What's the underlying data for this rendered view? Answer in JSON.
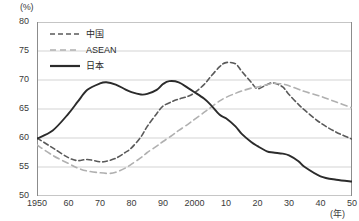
{
  "chart_data": {
    "type": "line",
    "title": "",
    "subtitle": "",
    "ylabel": "(%)",
    "xlabel": "(年)",
    "ylim": [
      50,
      80
    ],
    "xlim": [
      1950,
      2050
    ],
    "yticks": [
      50,
      55,
      60,
      65,
      70,
      75,
      80
    ],
    "ytick_labels": [
      "50",
      "55",
      "60",
      "65",
      "70",
      "75",
      "80"
    ],
    "xticks": [
      1950,
      1960,
      1970,
      1980,
      1990,
      2000,
      2010,
      2020,
      2030,
      2040,
      2050
    ],
    "xtick_labels": [
      "1950",
      "60",
      "70",
      "80",
      "90",
      "2000",
      "10",
      "20",
      "30",
      "40",
      "50"
    ],
    "grid": true,
    "grid_axis": "y",
    "legend_position": "top-left",
    "series": [
      {
        "name": "中国",
        "style": "dashed",
        "color": "#5a5a5a",
        "x": [
          1950,
          1955,
          1960,
          1963,
          1966,
          1970,
          1972,
          1975,
          1978,
          1980,
          1983,
          1985,
          1988,
          1990,
          1993,
          1995,
          1998,
          2000,
          2003,
          2005,
          2008,
          2010,
          2013,
          2015,
          2018,
          2020,
          2023,
          2025,
          2028,
          2030,
          2033,
          2035,
          2040,
          2045,
          2050
        ],
        "values": [
          60.0,
          58.3,
          56.6,
          56.1,
          56.3,
          55.9,
          56.0,
          56.5,
          57.5,
          58.3,
          60.2,
          62.0,
          64.2,
          65.5,
          66.3,
          66.7,
          67.2,
          67.8,
          69.2,
          70.5,
          72.3,
          73.0,
          72.8,
          71.5,
          69.6,
          68.5,
          69.2,
          69.5,
          68.8,
          67.5,
          65.8,
          64.8,
          62.6,
          61.0,
          59.8
        ]
      },
      {
        "name": "ASEAN",
        "style": "dashed",
        "color": "#b0b0b0",
        "x": [
          1950,
          1955,
          1960,
          1963,
          1966,
          1970,
          1973,
          1975,
          1978,
          1980,
          1983,
          1985,
          1988,
          1990,
          1993,
          1995,
          1998,
          2000,
          2003,
          2005,
          2008,
          2010,
          2013,
          2015,
          2018,
          2020,
          2023,
          2025,
          2028,
          2030,
          2033,
          2035,
          2040,
          2045,
          2050
        ],
        "values": [
          58.8,
          57.0,
          55.6,
          54.8,
          54.3,
          54.0,
          53.9,
          54.1,
          54.8,
          55.5,
          56.6,
          57.5,
          58.6,
          59.4,
          60.5,
          61.3,
          62.4,
          63.2,
          64.4,
          65.2,
          66.4,
          67.0,
          67.7,
          68.1,
          68.6,
          68.8,
          69.2,
          69.4,
          69.3,
          69.0,
          68.4,
          68.0,
          67.2,
          66.2,
          65.2
        ]
      },
      {
        "name": "日本",
        "style": "solid",
        "color": "#2b2b2b",
        "x": [
          1950,
          1955,
          1960,
          1963,
          1966,
          1970,
          1972,
          1975,
          1978,
          1980,
          1983,
          1985,
          1988,
          1990,
          1992,
          1995,
          1998,
          2000,
          2003,
          2005,
          2008,
          2010,
          2013,
          2015,
          2018,
          2020,
          2023,
          2025,
          2028,
          2030,
          2033,
          2035,
          2040,
          2045,
          2050
        ],
        "values": [
          59.9,
          61.3,
          64.2,
          66.3,
          68.3,
          69.4,
          69.6,
          69.2,
          68.4,
          67.9,
          67.5,
          67.6,
          68.3,
          69.3,
          69.8,
          69.6,
          68.6,
          67.9,
          66.8,
          65.8,
          64.0,
          63.4,
          62.0,
          60.7,
          59.3,
          58.6,
          57.7,
          57.5,
          57.3,
          57.0,
          56.0,
          55.0,
          53.4,
          52.8,
          52.5
        ]
      }
    ]
  }
}
